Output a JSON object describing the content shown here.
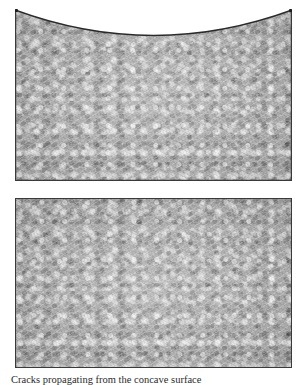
{
  "page": {
    "kind": "scanned-figure-plate",
    "background_color": "#ffffff",
    "width": 307,
    "height": 385
  },
  "figures": [
    {
      "id": "upper",
      "label": "upper-specimen-panel",
      "shape": "rectangle-with-concave-top-arc",
      "fill_color": "#aeaeae",
      "outline_color": "#3a3a3a",
      "x": 15,
      "y": 9,
      "width": 277,
      "height": 172,
      "arc_depth_px": 24,
      "description": "Grey mottled textured panel; its top edge is a shallow symmetric concave arc dipping from the upper corners toward the centre."
    },
    {
      "id": "lower",
      "label": "lower-specimen-panel",
      "shape": "rectangle",
      "fill_color": "#aeaeae",
      "outline_color": "#3a3a3a",
      "x": 15,
      "y": 198,
      "width": 277,
      "height": 170,
      "description": "Grey mottled textured panel with a plain straight top edge."
    }
  ],
  "caption": {
    "text": "Cracks propagating from the concave surface",
    "clipped": true,
    "note": "Caption line is cut off by the bottom edge of the scan; only the tops of the letters are visible."
  }
}
